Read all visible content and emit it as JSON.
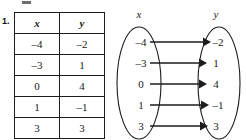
{
  "exercise": {
    "number": "1."
  },
  "table": {
    "headers": [
      "x",
      "y"
    ],
    "rows": [
      {
        "x": "–4",
        "y": "–2"
      },
      {
        "x": "–3",
        "y": "1"
      },
      {
        "x": "0",
        "y": "4"
      },
      {
        "x": "1",
        "y": "–1"
      },
      {
        "x": "3",
        "y": "3"
      }
    ]
  },
  "mapping_diagram": {
    "domain_label": "x",
    "range_label": "y",
    "domain_values": [
      "–4",
      "–3",
      "0",
      "1",
      "3"
    ],
    "range_values": [
      "–2",
      "1",
      "4",
      "–1",
      "3"
    ],
    "arrows": [
      {
        "from": "–4",
        "to": "–2"
      },
      {
        "from": "–3",
        "to": "1"
      },
      {
        "from": "0",
        "to": "4"
      },
      {
        "from": "1",
        "to": "–1"
      },
      {
        "from": "3",
        "to": "3"
      }
    ]
  },
  "colors": {
    "ink": "#1c1c1c",
    "paper": "#ffffff"
  }
}
